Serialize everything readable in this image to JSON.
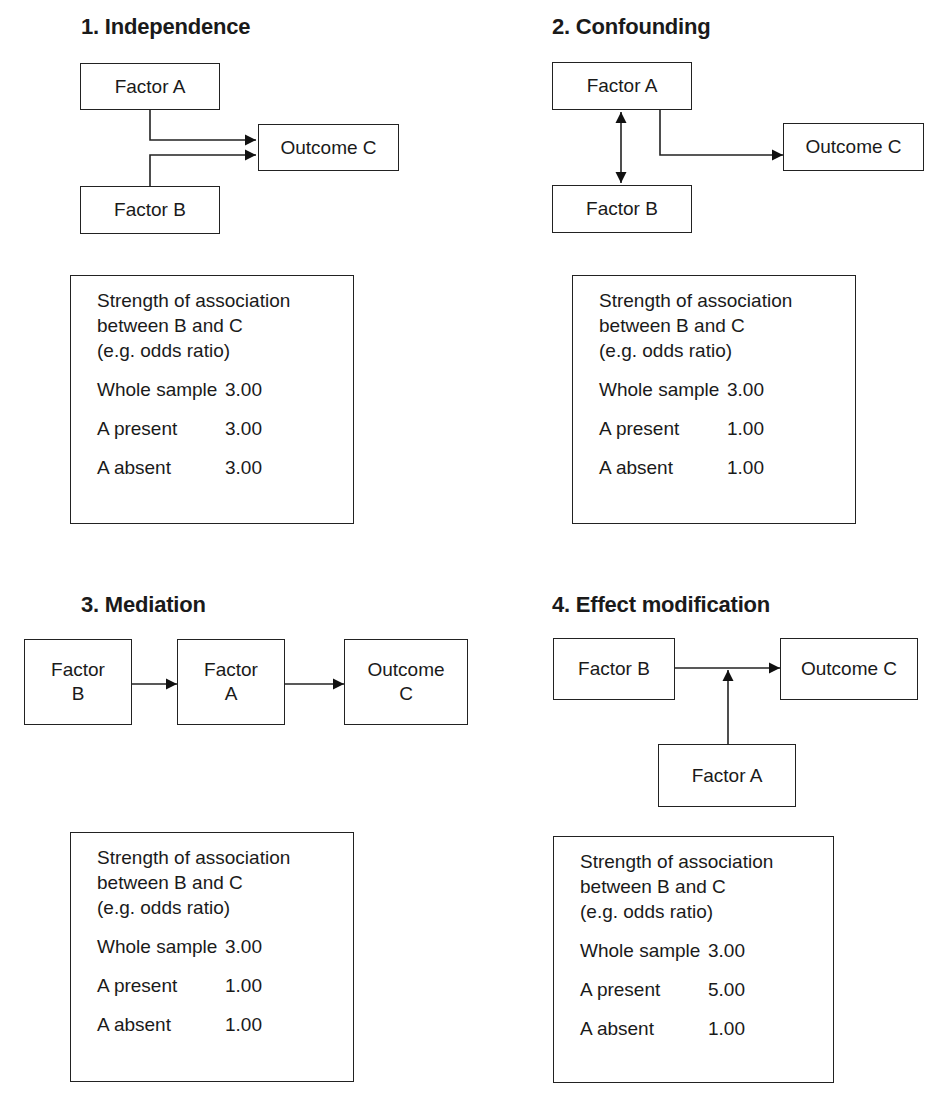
{
  "panels": [
    {
      "title": "1. Independence",
      "type": "independence",
      "nodes": {
        "a": "Factor A",
        "b": "Factor B",
        "c": "Outcome C"
      },
      "table": {
        "heading": [
          "Strength of association",
          "between B and C",
          "(e.g. odds ratio)"
        ],
        "rows": [
          {
            "label": "Whole sample",
            "value": "3.00"
          },
          {
            "label": "A present",
            "value": "3.00"
          },
          {
            "label": "A absent",
            "value": "3.00"
          }
        ]
      }
    },
    {
      "title": "2. Confounding",
      "type": "confounding",
      "nodes": {
        "a": "Factor A",
        "b": "Factor B",
        "c": "Outcome C"
      },
      "table": {
        "heading": [
          "Strength of association",
          "between B and C",
          "(e.g. odds ratio)"
        ],
        "rows": [
          {
            "label": "Whole sample",
            "value": "3.00"
          },
          {
            "label": "A present",
            "value": "1.00"
          },
          {
            "label": "A absent",
            "value": "1.00"
          }
        ]
      }
    },
    {
      "title": "3. Mediation",
      "type": "mediation",
      "nodes": {
        "b_line1": "Factor",
        "b_line2": "B",
        "a_line1": "Factor",
        "a_line2": "A",
        "c_line1": "Outcome",
        "c_line2": "C"
      },
      "table": {
        "heading": [
          "Strength of association",
          "between B and C",
          "(e.g. odds ratio)"
        ],
        "rows": [
          {
            "label": "Whole sample",
            "value": "3.00"
          },
          {
            "label": "A present",
            "value": "1.00"
          },
          {
            "label": "A absent",
            "value": "1.00"
          }
        ]
      }
    },
    {
      "title": "4. Effect modification",
      "type": "effect-modification",
      "nodes": {
        "a": "Factor A",
        "b": "Factor B",
        "c": "Outcome C"
      },
      "table": {
        "heading": [
          "Strength of association",
          "between B and C",
          "(e.g. odds ratio)"
        ],
        "rows": [
          {
            "label": "Whole sample",
            "value": "3.00"
          },
          {
            "label": "A present",
            "value": "5.00"
          },
          {
            "label": "A absent",
            "value": "1.00"
          }
        ]
      }
    }
  ]
}
